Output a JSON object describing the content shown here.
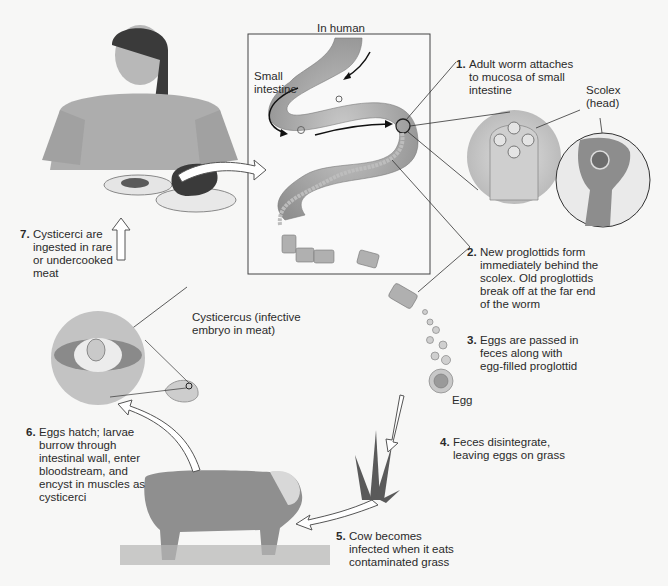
{
  "diagram": {
    "region_label": "In human",
    "labels": {
      "small_intestine": "Small\nintestine",
      "scolex": "Scolex\n(head)",
      "egg": "Egg",
      "cysticercus": "Cysticercus (infective\nembryo in meat)"
    },
    "steps": [
      {
        "num": "1.",
        "text": "Adult worm attaches\nto mucosa of small\nintestine"
      },
      {
        "num": "2.",
        "text": "New proglottids form\nimmediately behind the\nscolex. Old proglottids\nbreak off at the far end\nof the worm"
      },
      {
        "num": "3.",
        "text": "Eggs are passed in\nfeces along with\negg-filled proglottid"
      },
      {
        "num": "4.",
        "text": "Feces disintegrate,\nleaving eggs on grass"
      },
      {
        "num": "5.",
        "text": "Cow becomes\ninfected when it eats\ncontaminated grass"
      },
      {
        "num": "6.",
        "text": "Eggs hatch; larvae\nburrow through\nintestinal wall, enter\nbloodstream, and\nencyst in muscles as\ncysticerci"
      },
      {
        "num": "7.",
        "text": "Cysticerci are\ningested in rare\nor undercooked\nmeat"
      }
    ],
    "colors": {
      "background": "#f7f7f6",
      "intestine": "#a9a9a9",
      "box_border": "#444444",
      "arrow_fill": "#ffffff",
      "text": "#2b2b2b"
    }
  }
}
